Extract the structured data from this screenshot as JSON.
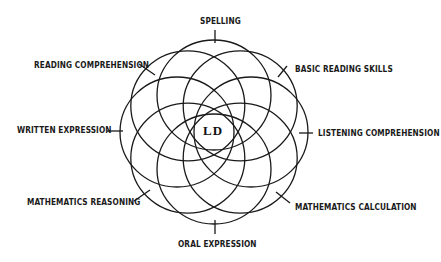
{
  "diagram": {
    "type": "overlapping-circles",
    "center": {
      "label": "LD",
      "x": 214,
      "y": 132
    },
    "ring_radius": 37,
    "circle_rx": 57,
    "circle_ry": 55,
    "stroke_color": "#1a1a1a",
    "areas": [
      {
        "label": "SPELLING",
        "angle": -90,
        "label_x": 200,
        "label_y": 17,
        "tick": [
          215,
          30,
          215,
          43
        ]
      },
      {
        "label": "BASIC READING SKILLS",
        "angle": -45,
        "label_x": 295,
        "label_y": 65,
        "tick": [
          287,
          66,
          278,
          77
        ]
      },
      {
        "label": "LISTENING COMPREHENSION",
        "angle": 0,
        "label_x": 318,
        "label_y": 129,
        "tick": [
          299,
          133,
          313,
          133
        ]
      },
      {
        "label": "MATHEMATICS CALCULATION",
        "angle": 45,
        "label_x": 295,
        "label_y": 203,
        "tick": [
          276,
          192,
          290,
          203
        ]
      },
      {
        "label": "ORAL EXPRESSION",
        "angle": 90,
        "label_x": 178,
        "label_y": 240,
        "tick": [
          215,
          220,
          215,
          234
        ]
      },
      {
        "label": "MATHEMATICS REASONING",
        "angle": 135,
        "label_x": 27,
        "label_y": 198,
        "tick": [
          134,
          201,
          150,
          190
        ]
      },
      {
        "label": "WRITTEN EXPRESSION",
        "angle": 180,
        "label_x": 17,
        "label_y": 126,
        "tick": [
          107,
          131,
          123,
          131
        ]
      },
      {
        "label": "READING COMPREHENSION",
        "angle": -135,
        "label_x": 34,
        "label_y": 61,
        "tick": [
          139,
          64,
          155,
          75
        ]
      }
    ]
  }
}
